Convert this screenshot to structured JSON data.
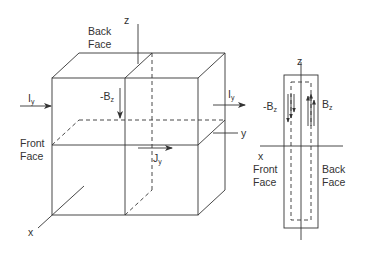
{
  "cube_view": {
    "axes": {
      "z": "z",
      "y": "y",
      "x": "x"
    },
    "back_face_label": [
      "Back",
      "Face"
    ],
    "front_face_label": [
      "Front",
      "Face"
    ],
    "current_in": {
      "main": "I",
      "sub": "y"
    },
    "current_out": {
      "main": "I",
      "sub": "y"
    },
    "field_neg": {
      "main": "-B",
      "sub": "z"
    },
    "current_density": {
      "main": "J",
      "sub": "y"
    }
  },
  "side_view": {
    "axes": {
      "z": "z",
      "x": "x"
    },
    "field_neg": {
      "main": "-B",
      "sub": "z"
    },
    "field_pos": {
      "main": "B",
      "sub": "z"
    },
    "front_face_label": [
      "Front",
      "Face"
    ],
    "back_face_label": [
      "Back",
      "Face"
    ]
  },
  "colors": {
    "line": "#333333",
    "background": "#ffffff"
  }
}
